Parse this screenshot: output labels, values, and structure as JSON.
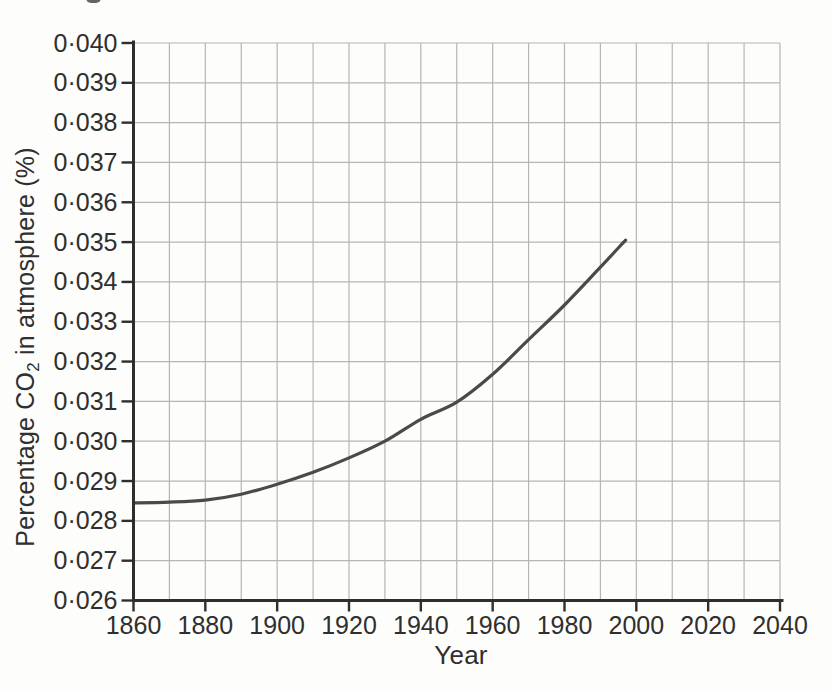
{
  "chart_data": {
    "type": "line",
    "xlabel": "Year",
    "ylabel": "Percentage CO2 in atmosphere (%)",
    "ylabel_parts": {
      "pre": "Percentage CO",
      "sub": "2",
      "post": " in atmosphere (%)"
    },
    "xlim": [
      1860,
      2040
    ],
    "ylim": [
      0.026,
      0.04
    ],
    "x_tick_step": 20,
    "x_grid_step": 10,
    "y_tick_step": 0.001,
    "x_tick_labels": [
      "1860",
      "1880",
      "1900",
      "1920",
      "1940",
      "1960",
      "1980",
      "2000",
      "2020",
      "2040"
    ],
    "y_tick_labels": [
      "0·026",
      "0·027",
      "0·028",
      "0·029",
      "0·030",
      "0·031",
      "0·032",
      "0·033",
      "0·034",
      "0·035",
      "0·036",
      "0·037",
      "0·038",
      "0·039",
      "0·040"
    ],
    "grid": true,
    "legend": "none",
    "series": [
      {
        "name": "CO2 percentage in atmosphere",
        "x": [
          1860,
          1870,
          1880,
          1890,
          1900,
          1910,
          1920,
          1930,
          1940,
          1950,
          1960,
          1970,
          1980,
          1990,
          1997
        ],
        "y": [
          0.02845,
          0.02847,
          0.02852,
          0.02867,
          0.02892,
          0.02922,
          0.02958,
          0.03,
          0.03055,
          0.03098,
          0.03168,
          0.03255,
          0.03342,
          0.03437,
          0.03505
        ]
      }
    ],
    "colors": {
      "curve": "#4a4a4a",
      "grid": "#b5b5b5",
      "axis": "#2e2e2e",
      "text": "#2f2f2f",
      "background": "#fdfdfb"
    }
  }
}
